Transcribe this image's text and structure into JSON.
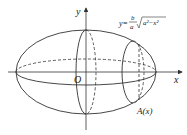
{
  "diagram": {
    "labels": {
      "y_axis": "y",
      "x_axis": "x",
      "origin": "O",
      "cross_section": "A(x)",
      "curve_eq_prefix": "y=",
      "curve_eq_num": "b",
      "curve_eq_den": "a",
      "curve_eq_radicand": "a²−x²"
    },
    "colors": {
      "stroke": "#333333",
      "background": "#ffffff"
    }
  }
}
